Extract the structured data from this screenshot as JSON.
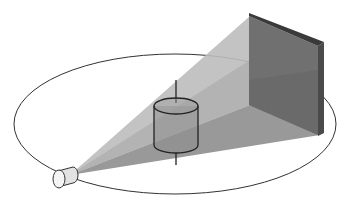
{
  "diagram": {
    "type": "ct-scanner-geometry",
    "elements": [
      {
        "name": "x-ray-source",
        "shape": "small cylinder",
        "position": "lower-left"
      },
      {
        "name": "gantry-orbit",
        "shape": "ellipse"
      },
      {
        "name": "object",
        "shape": "cylinder with vertical rotation axis",
        "position": "center"
      },
      {
        "name": "detector-panel",
        "shape": "flat panel",
        "position": "upper-right"
      },
      {
        "name": "x-ray-beam",
        "shape": "cone/fan from source to detector"
      }
    ],
    "colors": {
      "background": "#ffffff",
      "beam_light": "#b5b5b5",
      "beam_dark": "#8a8a8a",
      "detector_face": "#6e6e6e",
      "detector_edge": "#3a3a3a",
      "line": "#222222"
    }
  }
}
